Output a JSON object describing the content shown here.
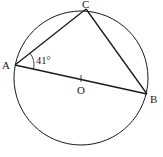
{
  "diagram": {
    "type": "geometry-circle-inscribed-triangle",
    "circle": {
      "center": [
        81,
        78
      ],
      "radius": 67,
      "center_label": "O"
    },
    "points": {
      "A": {
        "label": "A",
        "x": 15,
        "y": 65
      },
      "B": {
        "label": "B",
        "x": 147,
        "y": 94
      },
      "C": {
        "label": "C",
        "x": 86,
        "y": 9
      },
      "O": {
        "label": "O",
        "x": 81,
        "y": 79
      }
    },
    "segments": [
      {
        "from": "A",
        "to": "C"
      },
      {
        "from": "C",
        "to": "B"
      },
      {
        "from": "A",
        "to": "B",
        "note": "diameter through O"
      }
    ],
    "angle": {
      "vertex": "A",
      "between": [
        "C",
        "B"
      ],
      "label": "41°"
    },
    "colors": {
      "stroke": "#1a1a1a",
      "background": "#ffffff"
    }
  }
}
